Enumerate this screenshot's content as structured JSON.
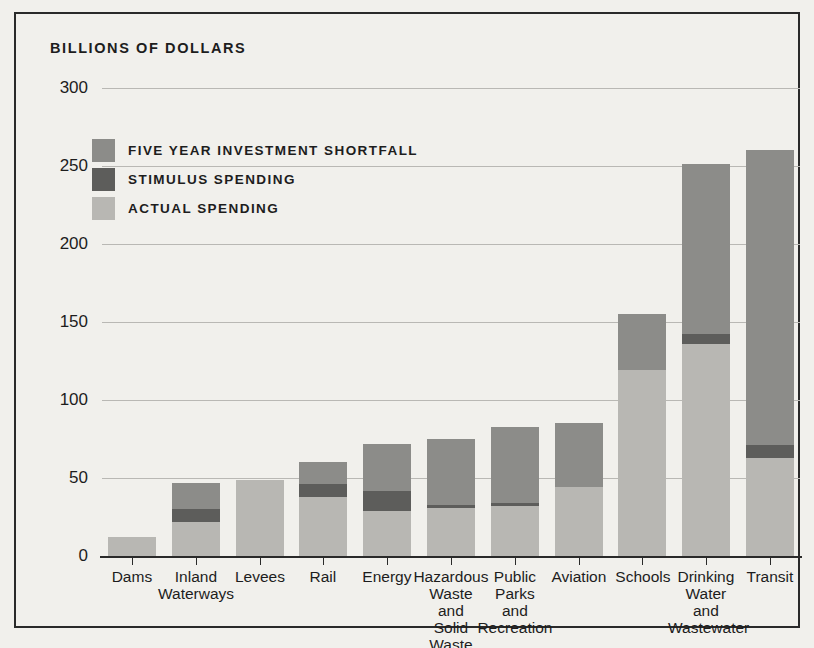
{
  "chart_data": {
    "type": "bar",
    "subtype": "stacked-vertical",
    "title": "BILLIONS OF DOLLARS",
    "xlabel": "",
    "ylabel": "BILLIONS OF DOLLARS",
    "ylim": [
      0,
      300
    ],
    "yticks": [
      0,
      50,
      100,
      150,
      200,
      250,
      300
    ],
    "ytick_labels": [
      "0",
      "50",
      "100",
      "150",
      "200",
      "250",
      "300"
    ],
    "grid": true,
    "legend_position": "upper-left-inside",
    "categories": [
      "Dams",
      "Inland Waterways",
      "Levees",
      "Rail",
      "Hazardous Waste and Solid Waste",
      "Energy",
      "Public Parks and Recreation",
      "Aviation",
      "Schools",
      "Drinking Water and Wastewater",
      "Transit"
    ],
    "category_lines": [
      [
        "Dams"
      ],
      [
        "Inland",
        "Waterways"
      ],
      [
        "Levees"
      ],
      [
        "Rail"
      ],
      [
        "Energy"
      ],
      [
        "Hazardous",
        "Waste",
        "and",
        "Solid",
        "Waste"
      ],
      [
        "Public",
        "Parks",
        "and",
        "Recreation"
      ],
      [
        "Aviation"
      ],
      [
        "Schools"
      ],
      [
        "Drinking",
        "Water",
        "and",
        "Wastewater"
      ],
      [
        "Transit"
      ]
    ],
    "series": [
      {
        "name": "ACTUAL SPENDING",
        "color": "#b8b7b3",
        "values": [
          12,
          22,
          49,
          38,
          29,
          31,
          32,
          44,
          119,
          136,
          63
        ]
      },
      {
        "name": "STIMULUS SPENDING",
        "color": "#5d5d5b",
        "values": [
          0,
          8,
          0,
          8,
          13,
          2,
          2,
          0,
          0,
          6,
          8
        ]
      },
      {
        "name": "FIVE YEAR INVESTMENT SHORTFALL",
        "color": "#8c8c89",
        "values": [
          0,
          17,
          0,
          14,
          30,
          42,
          49,
          41,
          36,
          109,
          189
        ]
      }
    ],
    "totals": [
      12,
      47,
      49,
      60,
      72,
      75,
      83,
      85,
      155,
      251,
      260
    ]
  },
  "legend": {
    "items": [
      {
        "label": "FIVE YEAR INVESTMENT SHORTFALL",
        "color": "#8c8c89"
      },
      {
        "label": "STIMULUS SPENDING",
        "color": "#5d5d5b"
      },
      {
        "label": "ACTUAL SPENDING",
        "color": "#b8b7b3"
      }
    ]
  },
  "colors": {
    "background": "#f1f0ec",
    "frame": "#2a2a2a",
    "gridline": "#b9b8b4",
    "text": "#1d1d1d"
  }
}
